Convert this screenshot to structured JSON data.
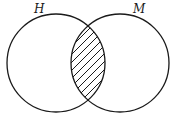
{
  "diagram": {
    "type": "venn",
    "sets": [
      {
        "id": "H",
        "label": "H"
      },
      {
        "id": "M",
        "label": "M"
      }
    ],
    "shaded_region": "intersection",
    "shading_style": "diagonal-hatch",
    "colors": {
      "stroke": "#1a1a1a",
      "background": "#ffffff"
    }
  }
}
